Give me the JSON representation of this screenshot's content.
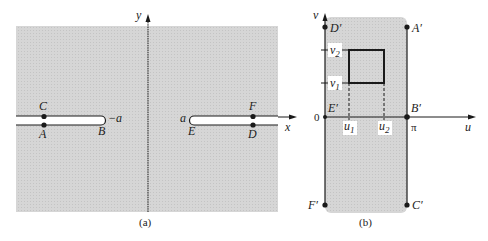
{
  "panel_a": {
    "caption": "(a)",
    "y_axis_label": "y",
    "x_axis_label": "x",
    "points": {
      "C": "C",
      "A": "A",
      "B": "B",
      "E": "E",
      "F": "F",
      "D": "D"
    },
    "neg_a": "−a",
    "pos_a": "a"
  },
  "panel_b": {
    "caption": "(b)",
    "v_axis_label": "v",
    "u_axis_label": "u",
    "origin": "0",
    "pi": "π",
    "points": {
      "D": "D′",
      "A": "A′",
      "E": "E′",
      "B": "B′",
      "F": "F′",
      "C": "C′"
    },
    "v1": "v",
    "v1_sub": "1",
    "v2": "v",
    "v2_sub": "2",
    "u1": "u",
    "u1_sub": "1",
    "u2": "u",
    "u2_sub": "2"
  },
  "colors": {
    "shade": "#d2d2d2",
    "ink": "#1a1a1a"
  }
}
